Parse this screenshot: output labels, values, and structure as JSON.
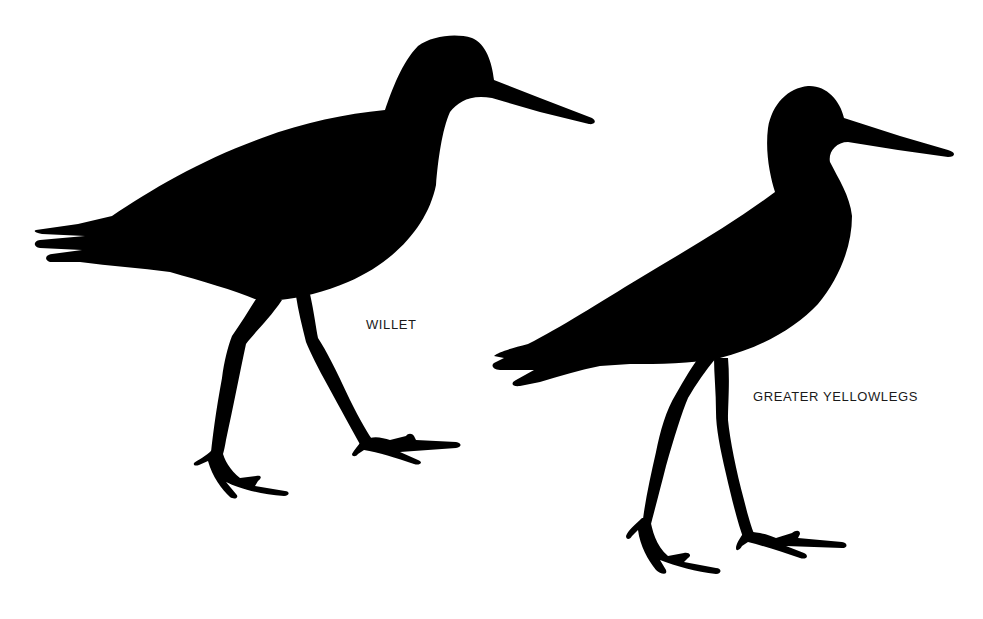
{
  "figure": {
    "background_color": "#ffffff",
    "silhouette_color": "#000000",
    "birds": [
      {
        "id": "willet",
        "label": "WILLET"
      },
      {
        "id": "greater-yellowlegs",
        "label": "GREATER YELLOWLEGS"
      }
    ]
  }
}
